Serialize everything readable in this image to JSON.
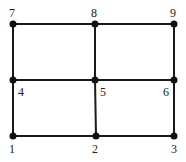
{
  "diagram": {
    "type": "grid-graph",
    "nodes": [
      {
        "id": "1",
        "label": "1",
        "x": 13,
        "y": 136,
        "lx": 9,
        "ly": 153
      },
      {
        "id": "2",
        "label": "2",
        "x": 96,
        "y": 136,
        "lx": 92,
        "ly": 153
      },
      {
        "id": "3",
        "label": "3",
        "x": 174,
        "y": 136,
        "lx": 171,
        "ly": 153
      },
      {
        "id": "4",
        "label": "4",
        "x": 13,
        "y": 80,
        "lx": 18,
        "ly": 96
      },
      {
        "id": "5",
        "label": "5",
        "x": 95,
        "y": 80,
        "lx": 100,
        "ly": 96
      },
      {
        "id": "6",
        "label": "6",
        "x": 174,
        "y": 80,
        "lx": 163,
        "ly": 96
      },
      {
        "id": "7",
        "label": "7",
        "x": 13,
        "y": 24,
        "lx": 9,
        "ly": 17
      },
      {
        "id": "8",
        "label": "8",
        "x": 95,
        "y": 24,
        "lx": 91,
        "ly": 17
      },
      {
        "id": "9",
        "label": "9",
        "x": 174,
        "y": 24,
        "lx": 170,
        "ly": 17
      }
    ],
    "edges": [
      [
        "7",
        "8"
      ],
      [
        "8",
        "9"
      ],
      [
        "4",
        "5"
      ],
      [
        "5",
        "6"
      ],
      [
        "1",
        "2"
      ],
      [
        "2",
        "3"
      ],
      [
        "7",
        "4"
      ],
      [
        "4",
        "1"
      ],
      [
        "8",
        "5"
      ],
      [
        "5",
        "2"
      ],
      [
        "9",
        "6"
      ],
      [
        "6",
        "3"
      ]
    ]
  }
}
